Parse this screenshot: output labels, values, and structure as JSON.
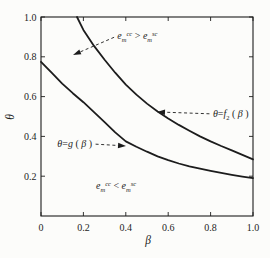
{
  "figure": {
    "background": "#fcfcfa",
    "line_color": "#1c1c1c",
    "text_color": "#1c1c1c"
  },
  "chart_data": {
    "type": "line",
    "title": "",
    "xlabel": "β",
    "ylabel": "θ",
    "xlim": [
      0,
      1
    ],
    "ylim": [
      0,
      1
    ],
    "grid": false,
    "legend": "none",
    "xticks": {
      "values": [
        0,
        0.2,
        0.4,
        0.6,
        0.8,
        1.0
      ],
      "labels": [
        "0",
        "0.2",
        "0.4",
        "0.6",
        "0.8",
        "1.0"
      ]
    },
    "yticks": {
      "values": [
        0.2,
        0.4,
        0.6,
        0.8,
        1.0
      ],
      "labels": [
        "0.2",
        "0.4",
        "0.6",
        "0.8",
        "1.0"
      ]
    },
    "series": [
      {
        "id": "f2",
        "name": "θ=f2(β)",
        "x": [
          0.17,
          0.2,
          0.25,
          0.3,
          0.35,
          0.4,
          0.45,
          0.5,
          0.55,
          0.6,
          0.65,
          0.7,
          0.75,
          0.8,
          0.85,
          0.9,
          0.95,
          1.0
        ],
        "y": [
          1.0,
          0.935,
          0.855,
          0.785,
          0.72,
          0.66,
          0.61,
          0.565,
          0.525,
          0.49,
          0.458,
          0.428,
          0.4,
          0.375,
          0.352,
          0.33,
          0.307,
          0.285
        ]
      },
      {
        "id": "g",
        "name": "θ=g(β)",
        "x": [
          0,
          0.05,
          0.1,
          0.15,
          0.2,
          0.25,
          0.3,
          0.35,
          0.4,
          0.45,
          0.5,
          0.55,
          0.6,
          0.65,
          0.7,
          0.75,
          0.8,
          0.85,
          0.9,
          0.95,
          1.0
        ],
        "y": [
          0.775,
          0.72,
          0.665,
          0.617,
          0.572,
          0.522,
          0.472,
          0.42,
          0.375,
          0.348,
          0.323,
          0.3,
          0.281,
          0.264,
          0.25,
          0.238,
          0.227,
          0.217,
          0.207,
          0.198,
          0.19
        ]
      }
    ],
    "annotations": [
      {
        "id": "region-upper-label",
        "plain": "e_m^cc > e_m^sc",
        "parts": [
          {
            "t": "e",
            "it": true
          },
          {
            "t": "m",
            "pos": "sub",
            "it": true
          },
          {
            "t": "cc",
            "pos": "sup",
            "it": true
          },
          {
            "t": " > "
          },
          {
            "t": "e",
            "it": true
          },
          {
            "t": "m",
            "pos": "sub",
            "it": true
          },
          {
            "t": "sc",
            "pos": "sup",
            "it": true
          }
        ],
        "text_xy": [
          0.36,
          0.905
        ],
        "anchor": "start",
        "arrow_to": [
          0.151,
          0.809
        ],
        "dashed": true
      },
      {
        "id": "f2-curve-label",
        "plain": "θ=f2(β)",
        "parts": [
          {
            "t": "θ",
            "it": true
          },
          {
            "t": "="
          },
          {
            "t": "f",
            "it": true
          },
          {
            "t": "2",
            "pos": "sub"
          },
          {
            "t": " ( "
          },
          {
            "t": "β",
            "it": true
          },
          {
            "t": " )"
          }
        ],
        "text_xy": [
          0.811,
          0.513
        ],
        "anchor": "start",
        "arrow_to": [
          0.547,
          0.523
        ],
        "dashed": true
      },
      {
        "id": "g-curve-label",
        "plain": "θ=g(β)",
        "parts": [
          {
            "t": "θ",
            "it": true
          },
          {
            "t": "="
          },
          {
            "t": "g",
            "it": true
          },
          {
            "t": " ( "
          },
          {
            "t": "β",
            "it": true
          },
          {
            "t": " )"
          }
        ],
        "text_xy": [
          0.241,
          0.362
        ],
        "anchor": "end",
        "arrow_to": [
          0.401,
          0.352
        ],
        "dashed": true
      },
      {
        "id": "region-lower-label",
        "plain": "e_m^cc < e_m^sc",
        "parts": [
          {
            "t": "e",
            "it": true
          },
          {
            "t": "m",
            "pos": "sub",
            "it": true
          },
          {
            "t": "cc",
            "pos": "sup",
            "it": true
          },
          {
            "t": " < "
          },
          {
            "t": "e",
            "it": true
          },
          {
            "t": "m",
            "pos": "sub",
            "it": true
          },
          {
            "t": "sc",
            "pos": "sup",
            "it": true
          }
        ],
        "text_xy": [
          0.354,
          0.151
        ],
        "anchor": "middle",
        "arrow_to": null,
        "dashed": false
      }
    ]
  }
}
